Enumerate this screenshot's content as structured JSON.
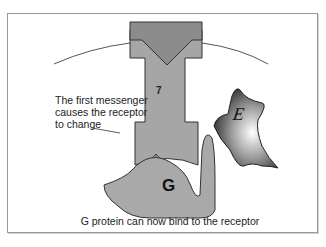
{
  "diagram": {
    "labels": {
      "first_messenger": "The first messenger causes the receptor to change",
      "caption": "G protein can now bind to the receptor",
      "receptor_segment": "7",
      "g_protein": "G",
      "effector": "E"
    },
    "colors": {
      "receptor_top": "#8c8c8c",
      "receptor_body": "#a6a6a6",
      "g_protein": "#a9a9a9",
      "outline": "#333333",
      "membrane": "#555555",
      "frame": "#9a9a9a"
    },
    "elements": [
      {
        "id": "membrane-arc",
        "type": "curve"
      },
      {
        "id": "receptor",
        "type": "shape",
        "label": "7"
      },
      {
        "id": "messenger-ligand",
        "type": "wedge"
      },
      {
        "id": "double-arrow",
        "type": "arrow"
      },
      {
        "id": "g-protein",
        "type": "shape",
        "label": "G"
      },
      {
        "id": "effector",
        "type": "shape",
        "label": "E"
      }
    ]
  }
}
